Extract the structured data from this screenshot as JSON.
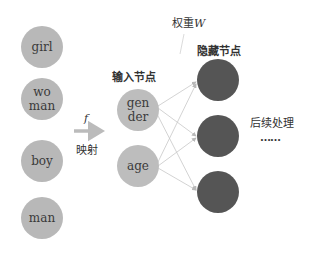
{
  "diagram": {
    "words": [
      {
        "label": "girl"
      },
      {
        "label": "wo\nman",
        "line1": "wo",
        "line2": "man"
      },
      {
        "label": "boy"
      },
      {
        "label": "man"
      }
    ],
    "mapping": {
      "symbol": "f",
      "label": "映射"
    },
    "input_layer": {
      "title": "输入节点",
      "nodes": [
        {
          "line1": "gen",
          "line2": "der"
        },
        {
          "line1": "age"
        }
      ]
    },
    "weights": {
      "label": "权重",
      "symbol": "W"
    },
    "hidden_layer": {
      "title": "隐藏节点",
      "node_count": 3
    },
    "post": {
      "label": "后续处理",
      "ellipsis": "……"
    },
    "colors": {
      "word_node": "#b8b8b8",
      "input_node": "#bdbdbd",
      "hidden_node": "#555555",
      "arrow": "#bbbbbb",
      "edges": "#c8c8c8"
    }
  }
}
